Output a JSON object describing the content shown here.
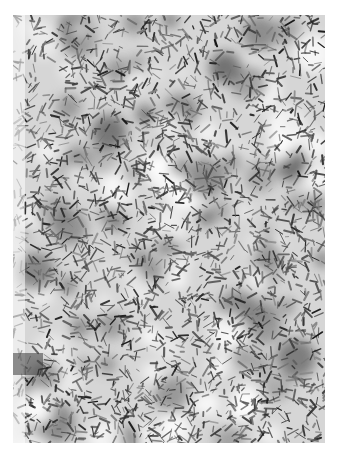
{
  "image": {
    "description": "Grayscale photograph of a dense texture of scattered dark needle-like fragments on a light background",
    "palette": {
      "background": "#ffffff",
      "light": "#f2f2f2",
      "mid": "#8a8a8a",
      "dark": "#1e1e1e"
    },
    "frame": {
      "left": 13,
      "top": 15,
      "width": 312,
      "height": 428
    }
  }
}
